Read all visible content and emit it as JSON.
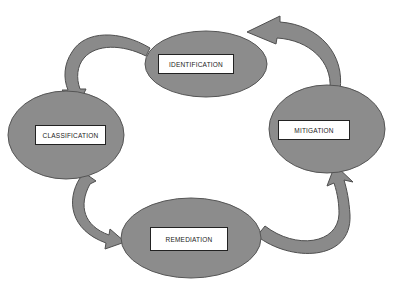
{
  "diagram": {
    "type": "cycle",
    "colors": {
      "node_fill": "#8c8c8c",
      "node_stroke": "#555555",
      "arrow_fill": "#8a8a8a",
      "arrow_stroke": "#4f4f4f",
      "label_bg": "#ffffff",
      "label_border": "#222222"
    },
    "nodes": [
      {
        "id": "identification",
        "label": "IDENTIFICATION"
      },
      {
        "id": "mitigation",
        "label": "MITIGATION"
      },
      {
        "id": "remediation",
        "label": "REMEDIATION"
      },
      {
        "id": "classification",
        "label": "CLASSIFICATION"
      }
    ],
    "edges": [
      {
        "from": "identification",
        "to": "classification"
      },
      {
        "from": "classification",
        "to": "remediation"
      },
      {
        "from": "remediation",
        "to": "mitigation"
      },
      {
        "from": "mitigation",
        "to": "identification"
      }
    ]
  }
}
